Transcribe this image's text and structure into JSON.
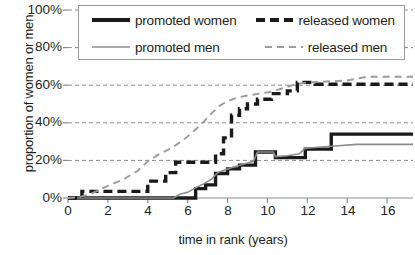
{
  "chart_data": {
    "type": "line",
    "title": "",
    "xlabel": "time in rank (years)",
    "ylabel": "proportion of women or men",
    "xlim": [
      0,
      17.3
    ],
    "ylim": [
      0,
      1.0
    ],
    "grid": "horizontal-dashed",
    "legend_position": "top",
    "x_ticks": [
      0,
      2,
      4,
      6,
      8,
      10,
      12,
      14,
      16
    ],
    "x_tick_labels": [
      "0",
      "2",
      "4",
      "6",
      "8",
      "10",
      "12",
      "14",
      "16"
    ],
    "y_ticks": [
      0,
      0.2,
      0.4,
      0.6,
      0.8,
      1.0
    ],
    "y_tick_labels": [
      "0%",
      "20%",
      "40%",
      "60%",
      "80%",
      "100%"
    ],
    "series": [
      {
        "name": "promoted women",
        "style": "solid",
        "color": "#1a1a1a",
        "width": 3.4,
        "points": [
          [
            0,
            0.0
          ],
          [
            6.4,
            0.0
          ],
          [
            6.4,
            0.05
          ],
          [
            6.9,
            0.05
          ],
          [
            6.9,
            0.07
          ],
          [
            7.4,
            0.07
          ],
          [
            7.4,
            0.13
          ],
          [
            8.0,
            0.13
          ],
          [
            8.0,
            0.155
          ],
          [
            8.6,
            0.155
          ],
          [
            8.6,
            0.175
          ],
          [
            9.4,
            0.175
          ],
          [
            9.4,
            0.245
          ],
          [
            10.4,
            0.245
          ],
          [
            10.4,
            0.215
          ],
          [
            11.9,
            0.215
          ],
          [
            11.9,
            0.26
          ],
          [
            13.2,
            0.26
          ],
          [
            13.2,
            0.34
          ],
          [
            17.3,
            0.34
          ]
        ]
      },
      {
        "name": "promoted men",
        "style": "solid",
        "color": "#8c8c8c",
        "width": 1.6,
        "points": [
          [
            0,
            0.0
          ],
          [
            5.3,
            0.0
          ],
          [
            5.6,
            0.02
          ],
          [
            6.0,
            0.03
          ],
          [
            6.4,
            0.055
          ],
          [
            6.8,
            0.075
          ],
          [
            7.2,
            0.1
          ],
          [
            7.5,
            0.135
          ],
          [
            7.9,
            0.15
          ],
          [
            8.3,
            0.165
          ],
          [
            8.8,
            0.18
          ],
          [
            9.3,
            0.195
          ],
          [
            9.5,
            0.245
          ],
          [
            10.3,
            0.245
          ],
          [
            10.4,
            0.22
          ],
          [
            11.0,
            0.225
          ],
          [
            11.6,
            0.235
          ],
          [
            11.9,
            0.265
          ],
          [
            13.2,
            0.275
          ],
          [
            14.5,
            0.285
          ],
          [
            17.3,
            0.285
          ]
        ]
      },
      {
        "name": "released women",
        "style": "dashed-thick",
        "color": "#1a1a1a",
        "width": 3.4,
        "points": [
          [
            0,
            0.0
          ],
          [
            0.7,
            0.0
          ],
          [
            0.7,
            0.035
          ],
          [
            4.0,
            0.035
          ],
          [
            4.0,
            0.09
          ],
          [
            4.9,
            0.09
          ],
          [
            4.9,
            0.135
          ],
          [
            5.4,
            0.135
          ],
          [
            5.4,
            0.19
          ],
          [
            7.4,
            0.19
          ],
          [
            7.4,
            0.235
          ],
          [
            7.8,
            0.235
          ],
          [
            7.8,
            0.32
          ],
          [
            8.2,
            0.32
          ],
          [
            8.2,
            0.44
          ],
          [
            8.6,
            0.44
          ],
          [
            8.6,
            0.475
          ],
          [
            9.0,
            0.475
          ],
          [
            9.0,
            0.5
          ],
          [
            9.5,
            0.5
          ],
          [
            9.5,
            0.525
          ],
          [
            10.2,
            0.525
          ],
          [
            10.2,
            0.555
          ],
          [
            11.0,
            0.555
          ],
          [
            11.0,
            0.57
          ],
          [
            11.5,
            0.57
          ],
          [
            11.5,
            0.615
          ],
          [
            12.4,
            0.615
          ],
          [
            12.4,
            0.605
          ],
          [
            17.3,
            0.605
          ]
        ]
      },
      {
        "name": "released men",
        "style": "dashed-thin",
        "color": "#9b9b9b",
        "width": 1.9,
        "points": [
          [
            0,
            0.0
          ],
          [
            0.6,
            0.005
          ],
          [
            1.2,
            0.025
          ],
          [
            2.0,
            0.065
          ],
          [
            2.8,
            0.1
          ],
          [
            3.5,
            0.145
          ],
          [
            4.0,
            0.195
          ],
          [
            4.6,
            0.235
          ],
          [
            5.2,
            0.265
          ],
          [
            5.8,
            0.31
          ],
          [
            6.3,
            0.355
          ],
          [
            6.8,
            0.405
          ],
          [
            7.2,
            0.45
          ],
          [
            7.6,
            0.49
          ],
          [
            8.0,
            0.515
          ],
          [
            8.5,
            0.535
          ],
          [
            9.0,
            0.545
          ],
          [
            9.6,
            0.555
          ],
          [
            10.2,
            0.565
          ],
          [
            10.8,
            0.585
          ],
          [
            11.4,
            0.605
          ],
          [
            12.0,
            0.615
          ],
          [
            13.0,
            0.62
          ],
          [
            14.0,
            0.625
          ],
          [
            15.0,
            0.645
          ],
          [
            16.0,
            0.645
          ],
          [
            17.3,
            0.645
          ]
        ]
      }
    ]
  },
  "legend": {
    "items": [
      {
        "label": "promoted women",
        "swatch": "solid-thick-black"
      },
      {
        "label": "released women",
        "swatch": "dashed-thick-black"
      },
      {
        "label": "promoted men",
        "swatch": "solid-thin-gray"
      },
      {
        "label": "released men",
        "swatch": "dashed-thin-gray"
      }
    ]
  },
  "colors": {
    "women": "#1a1a1a",
    "men": "#8c8c8c",
    "grid": "#8c8c8c",
    "axis": "#8c8c8c",
    "text": "#231f20"
  }
}
